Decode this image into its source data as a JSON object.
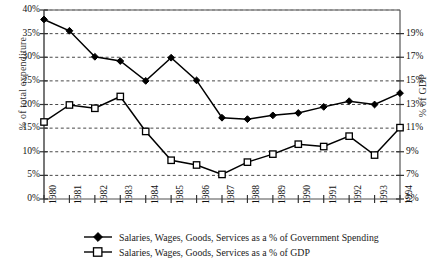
{
  "chart_data": {
    "type": "line",
    "title": "",
    "xlabel": "",
    "categories": [
      "1980",
      "1981",
      "1982",
      "1983",
      "1984",
      "1985",
      "1986",
      "1987",
      "1988",
      "1989",
      "1990",
      "1991",
      "1992",
      "1993",
      "1994"
    ],
    "grid": true,
    "legend_position": "bottom",
    "left_axis": {
      "label": "% of total expenditure",
      "ticks": [
        "0%",
        "5%",
        "10%",
        "15%",
        "20%",
        "25%",
        "30%",
        "35%",
        "40%"
      ],
      "tick_values": [
        0,
        5,
        10,
        15,
        20,
        25,
        30,
        35,
        40
      ],
      "lim": [
        0,
        40
      ]
    },
    "right_axis": {
      "label": "% of GDP",
      "ticks": [
        "5%",
        "7%",
        "9%",
        "11%",
        "13%",
        "15%",
        "17%",
        "19%"
      ],
      "tick_values": [
        5,
        7,
        9,
        11,
        13,
        15,
        17,
        19
      ],
      "lim": [
        5,
        21
      ]
    },
    "series": [
      {
        "name": "Salaries, Wages, Goods, Services as a % of Government Spending",
        "axis": "left",
        "marker": "filled-diamond",
        "values": [
          38.0,
          35.6,
          30.1,
          29.2,
          25.0,
          29.9,
          25.1,
          17.2,
          16.9,
          17.7,
          18.2,
          19.5,
          20.7,
          20.0,
          22.4
        ]
      },
      {
        "name": "Salaries, Wages, Goods, Services as a % of GDP",
        "axis": "right",
        "marker": "open-square",
        "values_left_scale": [
          16.3,
          19.9,
          19.2,
          21.7,
          14.3,
          8.2,
          7.2,
          5.2,
          7.8,
          9.5,
          11.6,
          11.1,
          13.3,
          9.3,
          15.1
        ],
        "values": [
          11.2,
          12.9,
          12.7,
          13.4,
          10.8,
          8.5,
          8.1,
          7.1,
          8.3,
          9.0,
          9.8,
          9.6,
          10.4,
          8.9,
          11.4
        ]
      }
    ]
  },
  "legend": {
    "items": [
      {
        "label": "Salaries, Wages, Goods, Services as a % of Government Spending",
        "marker": "filled-diamond"
      },
      {
        "label": "Salaries, Wages, Goods, Services as a % of GDP",
        "marker": "open-square"
      }
    ]
  },
  "colors": {
    "line": "#000000",
    "grid": "#333333",
    "axis": "#555555",
    "text": "#111111"
  }
}
